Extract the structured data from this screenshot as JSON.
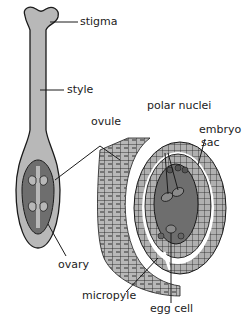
{
  "figure": {
    "labels": {
      "stigma": "stigma",
      "style": "style",
      "ovule": "ovule",
      "ovary": "ovary",
      "polar_nuclei": "polar nuclei",
      "embryo_sac_line1": "embryo",
      "embryo_sac_line2": "sac",
      "micropyle": "micropyle",
      "egg_cell": "egg cell"
    },
    "colors": {
      "tissue_light": "#b8b8b8",
      "tissue_dark": "#6e6e6e",
      "outline": "#1a1a1a",
      "background": "#ffffff"
    }
  }
}
